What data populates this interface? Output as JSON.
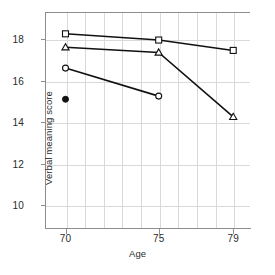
{
  "chart_data": {
    "type": "line",
    "title": "",
    "xlabel": "Age",
    "ylabel": "Verbal meaning score",
    "x": [
      70,
      75,
      79
    ],
    "xlim": [
      68.9,
      79.9
    ],
    "ylim": [
      8.9,
      19.3
    ],
    "xticks": [
      70,
      75,
      79
    ],
    "xtick_labels": [
      "70",
      "75",
      "79"
    ],
    "yticks": [
      10,
      12,
      14,
      16,
      18
    ],
    "ytick_labels": [
      "10",
      "12",
      "14",
      "16",
      "18"
    ],
    "grid": "both, light gray",
    "legend": "none",
    "series": [
      {
        "name": "square-series",
        "marker": "open-square",
        "x": [
          70,
          75,
          79
        ],
        "values": [
          18.25,
          17.95,
          17.45
        ]
      },
      {
        "name": "triangle-series",
        "marker": "open-triangle",
        "x": [
          70,
          75,
          79
        ],
        "values": [
          17.6,
          17.35,
          14.25
        ]
      },
      {
        "name": "circle-series",
        "marker": "open-circle",
        "x": [
          70,
          75
        ],
        "values": [
          16.6,
          15.25
        ]
      },
      {
        "name": "single-point-series",
        "marker": "filled-circle",
        "x": [
          70
        ],
        "values": [
          15.1
        ]
      }
    ],
    "line_color": "#111111",
    "marker_fill": "#ffffff",
    "grid_color": "#d9d9d9",
    "axis_color": "#8d8d8d"
  },
  "caption": ""
}
